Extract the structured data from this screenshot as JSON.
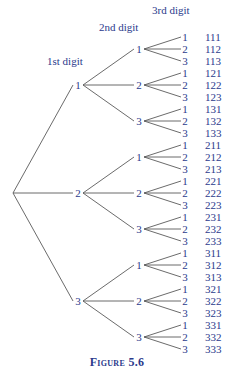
{
  "headers": {
    "first": "1st digit",
    "second": "2nd digit",
    "third": "3rd digit"
  },
  "tree": {
    "root": {
      "x": 13,
      "y": 193
    },
    "level1_digits": [
      "1",
      "2",
      "3"
    ],
    "level2_digits": [
      "1",
      "2",
      "3"
    ],
    "level3_digits": [
      "1",
      "2",
      "3"
    ]
  },
  "outcomes": [
    "111",
    "112",
    "113",
    "121",
    "122",
    "123",
    "131",
    "132",
    "133",
    "211",
    "212",
    "213",
    "221",
    "222",
    "223",
    "231",
    "232",
    "233",
    "311",
    "312",
    "313",
    "321",
    "322",
    "323",
    "331",
    "332",
    "333"
  ],
  "caption": "Figure 5.6",
  "colors": {
    "text": "#2b3a8c",
    "lines": "#5a5a5a"
  }
}
